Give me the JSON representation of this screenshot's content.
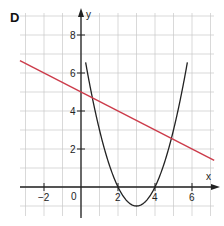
{
  "panel_label": "D",
  "colors": {
    "grid": "#c8c8c8",
    "axis": "#222222",
    "line": "#cc3b4a",
    "parabola": "#222222"
  },
  "chart_data": {
    "type": "line",
    "title": "D",
    "xlabel": "x",
    "ylabel": "y",
    "xlim": [
      -3.3,
      7.2
    ],
    "ylim": [
      -1.5,
      9.2
    ],
    "grid": true,
    "x_ticks": [
      -2,
      0,
      2,
      4,
      6
    ],
    "x_tick_labels": [
      "−2",
      "0",
      "2",
      "4",
      "6"
    ],
    "y_ticks": [
      2,
      4,
      6,
      8
    ],
    "y_tick_labels": [
      "2",
      "4",
      "6",
      "8"
    ],
    "origin_label": "0",
    "series": [
      {
        "name": "linear",
        "equation": "y = -0.5x + 5",
        "color": "#cc3b4a",
        "x": [
          -3.3,
          7.2
        ],
        "y": [
          6.65,
          1.4
        ]
      },
      {
        "name": "parabola",
        "equation": "y = (x - 3)^2 - 1",
        "color": "#222222",
        "vertex": [
          3,
          -1
        ],
        "roots": [
          2,
          4
        ]
      }
    ]
  }
}
